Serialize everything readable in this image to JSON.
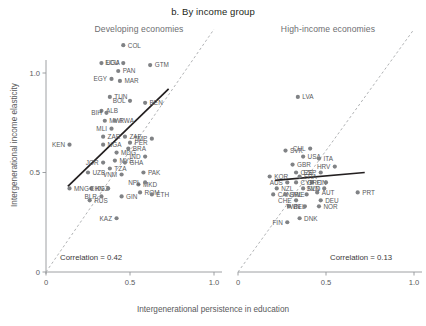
{
  "title": "b. By income group",
  "panels": {
    "left": {
      "title": "Developing economies",
      "correlation_label": "Correlation = 0.42"
    },
    "right": {
      "title": "High-income economies",
      "correlation_label": "Correlation = 0.13"
    }
  },
  "axes": {
    "xlabel": "Intergenerational persistence in education",
    "ylabel": "Intergenerational income elasticity",
    "xticks": [
      "0",
      "0.5",
      "1.0"
    ],
    "yticks": [
      "0",
      "0.5",
      "1.0"
    ],
    "xlim": [
      0,
      1.05
    ],
    "ylim": [
      0,
      1.22
    ]
  },
  "colors": {
    "point": "#808285",
    "trend": "#231f20",
    "diagonal": "#a7a9ac",
    "axis": "#939598",
    "text": "#58595b",
    "title": "#231f20",
    "panel_title": "#6d6e71"
  },
  "chart_data": {
    "type": "scatter",
    "title": "b. By income group",
    "xlabel": "Intergenerational persistence in education",
    "ylabel": "Intergenerational income elasticity",
    "xlim": [
      0,
      1.05
    ],
    "ylim": [
      0,
      1.22
    ],
    "grid": false,
    "legend": "none",
    "annotations": [
      {
        "panel": "Developing economies",
        "text": "Correlation = 0.42"
      },
      {
        "panel": "High-income economies",
        "text": "Correlation = 0.13"
      }
    ],
    "reference_line": {
      "type": "45-degree dashed",
      "from": [
        0,
        0
      ],
      "to": [
        1.0,
        1.22
      ]
    },
    "series": [
      {
        "name": "Developing economies",
        "correlation": 0.42,
        "trend_line": {
          "from": [
            0.13,
            0.43
          ],
          "to": [
            0.73,
            0.92
          ]
        },
        "points": [
          {
            "label": "COL",
            "x": 0.46,
            "y": 1.14
          },
          {
            "label": "UGA",
            "x": 0.33,
            "y": 1.05
          },
          {
            "label": "ECU",
            "x": 0.46,
            "y": 1.05
          },
          {
            "label": "GTM",
            "x": 0.62,
            "y": 1.04
          },
          {
            "label": "PAN",
            "x": 0.43,
            "y": 1.01
          },
          {
            "label": "EGY",
            "x": 0.39,
            "y": 0.97
          },
          {
            "label": "MAR",
            "x": 0.44,
            "y": 0.96
          },
          {
            "label": "TUN",
            "x": 0.38,
            "y": 0.88
          },
          {
            "label": "BOL",
            "x": 0.5,
            "y": 0.86
          },
          {
            "label": "BEN",
            "x": 0.59,
            "y": 0.85
          },
          {
            "label": "ALB",
            "x": 0.33,
            "y": 0.81
          },
          {
            "label": "BIH",
            "x": 0.36,
            "y": 0.8
          },
          {
            "label": "MWI",
            "x": 0.35,
            "y": 0.76
          },
          {
            "label": "RWA",
            "x": 0.41,
            "y": 0.76
          },
          {
            "label": "MLI",
            "x": 0.39,
            "y": 0.72
          },
          {
            "label": "ZAR",
            "x": 0.34,
            "y": 0.68
          },
          {
            "label": "ZAF",
            "x": 0.47,
            "y": 0.68
          },
          {
            "label": "TMP",
            "x": 0.63,
            "y": 0.67
          },
          {
            "label": "NGA",
            "x": 0.34,
            "y": 0.64
          },
          {
            "label": "PER",
            "x": 0.5,
            "y": 0.65
          },
          {
            "label": "KEN",
            "x": 0.14,
            "y": 0.64
          },
          {
            "label": "BRA",
            "x": 0.49,
            "y": 0.62
          },
          {
            "label": "MDG",
            "x": 0.42,
            "y": 0.6
          },
          {
            "label": "IND",
            "x": 0.59,
            "y": 0.58
          },
          {
            "label": "MYS",
            "x": 0.41,
            "y": 0.56
          },
          {
            "label": "GHA",
            "x": 0.47,
            "y": 0.55
          },
          {
            "label": "JOR",
            "x": 0.34,
            "y": 0.55
          },
          {
            "label": "TZA",
            "x": 0.38,
            "y": 0.52
          },
          {
            "label": "PAK",
            "x": 0.58,
            "y": 0.5
          },
          {
            "label": "VNM",
            "x": 0.45,
            "y": 0.49
          },
          {
            "label": "UZB",
            "x": 0.25,
            "y": 0.5
          },
          {
            "label": "MKD",
            "x": 0.55,
            "y": 0.44
          },
          {
            "label": "NPL",
            "x": 0.59,
            "y": 0.45
          },
          {
            "label": "MNG",
            "x": 0.14,
            "y": 0.42
          },
          {
            "label": "KGZ",
            "x": 0.27,
            "y": 0.42
          },
          {
            "label": "CHN",
            "x": 0.37,
            "y": 0.42
          },
          {
            "label": "ROM",
            "x": 0.56,
            "y": 0.4
          },
          {
            "label": "ETH",
            "x": 0.63,
            "y": 0.39
          },
          {
            "label": "BLR",
            "x": 0.33,
            "y": 0.38
          },
          {
            "label": "GIN",
            "x": 0.45,
            "y": 0.38
          },
          {
            "label": "RUS",
            "x": 0.26,
            "y": 0.36
          },
          {
            "label": "KAZ",
            "x": 0.42,
            "y": 0.27
          }
        ]
      },
      {
        "name": "High-income economies",
        "correlation": 0.13,
        "trend_line": {
          "from": [
            0.21,
            0.46
          ],
          "to": [
            0.72,
            0.5
          ]
        },
        "points": [
          {
            "label": "LVA",
            "x": 0.34,
            "y": 0.88
          },
          {
            "label": "SVK",
            "x": 0.27,
            "y": 0.61
          },
          {
            "label": "CHL",
            "x": 0.41,
            "y": 0.62
          },
          {
            "label": "USA",
            "x": 0.37,
            "y": 0.58
          },
          {
            "label": "ITA",
            "x": 0.46,
            "y": 0.57
          },
          {
            "label": "HRV",
            "x": 0.55,
            "y": 0.53
          },
          {
            "label": "GBR",
            "x": 0.31,
            "y": 0.54
          },
          {
            "label": "CZE",
            "x": 0.33,
            "y": 0.5
          },
          {
            "label": "ESP",
            "x": 0.47,
            "y": 0.5
          },
          {
            "label": "KOR",
            "x": 0.18,
            "y": 0.48
          },
          {
            "label": "FRA",
            "x": 0.35,
            "y": 0.48
          },
          {
            "label": "AUS",
            "x": 0.28,
            "y": 0.45
          },
          {
            "label": "CYP",
            "x": 0.33,
            "y": 0.45
          },
          {
            "label": "FIN",
            "x": 0.42,
            "y": 0.45
          },
          {
            "label": "GRC",
            "x": 0.5,
            "y": 0.45
          },
          {
            "label": "NZL",
            "x": 0.22,
            "y": 0.42
          },
          {
            "label": "NLD",
            "x": 0.37,
            "y": 0.42
          },
          {
            "label": "SVN",
            "x": 0.49,
            "y": 0.42
          },
          {
            "label": "CAN",
            "x": 0.2,
            "y": 0.39
          },
          {
            "label": "SWE",
            "x": 0.27,
            "y": 0.39
          },
          {
            "label": "IRL",
            "x": 0.39,
            "y": 0.39
          },
          {
            "label": "AUT",
            "x": 0.45,
            "y": 0.4
          },
          {
            "label": "PRT",
            "x": 0.68,
            "y": 0.4
          },
          {
            "label": "CHE",
            "x": 0.33,
            "y": 0.36
          },
          {
            "label": "DEU",
            "x": 0.47,
            "y": 0.36
          },
          {
            "label": "BEL",
            "x": 0.29,
            "y": 0.33
          },
          {
            "label": "TWN",
            "x": 0.38,
            "y": 0.33
          },
          {
            "label": "NOR",
            "x": 0.46,
            "y": 0.33
          },
          {
            "label": "DNK",
            "x": 0.35,
            "y": 0.27
          },
          {
            "label": "FIN",
            "x": 0.28,
            "y": 0.25
          }
        ]
      }
    ]
  }
}
